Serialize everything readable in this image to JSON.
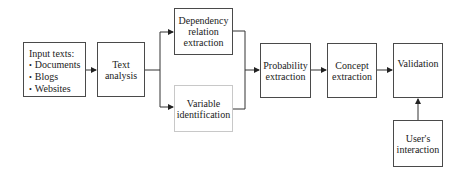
{
  "diagram": {
    "type": "flowchart",
    "nodes": {
      "input": {
        "title": "Input texts:",
        "items": [
          "Documents",
          "Blogs",
          "Websites"
        ]
      },
      "text_analysis": {
        "label": "Text\nanalysis"
      },
      "dependency": {
        "label": "Dependency\nrelation\nextraction"
      },
      "variable": {
        "label": "Variable\nidentification"
      },
      "probability": {
        "label": "Probability\nextraction"
      },
      "concept": {
        "label": "Concept\nextraction"
      },
      "validation": {
        "label": "Validation"
      },
      "user": {
        "label": "User's\ninteraction"
      }
    },
    "edges": [
      [
        "input",
        "text_analysis"
      ],
      [
        "text_analysis",
        "dependency"
      ],
      [
        "text_analysis",
        "variable"
      ],
      [
        "dependency",
        "probability"
      ],
      [
        "variable",
        "probability"
      ],
      [
        "probability",
        "concept"
      ],
      [
        "concept",
        "validation"
      ],
      [
        "user",
        "validation"
      ]
    ],
    "colors": {
      "border": "#4a4a4a",
      "border_light": "#c8c8c8",
      "line": "#333333"
    }
  }
}
